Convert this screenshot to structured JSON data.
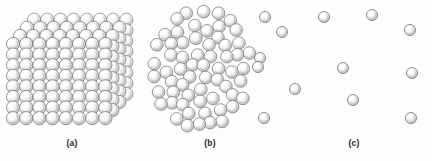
{
  "figure": {
    "name": "states-of-matter-sphere-packing",
    "background_color": "#fdfdfd",
    "sphere_style": {
      "fill_light": "#fdfdfd",
      "fill_mid": "#e4e4e4",
      "fill_shadow": "#bdbdbd",
      "outline_color": "#6f6f6f",
      "highlight_color": "#ffffff"
    }
  },
  "panels": [
    {
      "id": "a",
      "caption": "(a)",
      "description": "ordered cubic close-packed lattice of spheres (solid)",
      "arrangement": "crystalline-cubic-lattice",
      "lattice": {
        "columns": 8,
        "rows": 8,
        "depth_layers": 4,
        "sphere_diameter_px": 13.2,
        "origin_x": 13,
        "origin_y": 44,
        "step_x": 13.2,
        "step_y": 10.6,
        "depth_dx": 7.0,
        "depth_dy": -8.1
      }
    },
    {
      "id": "b",
      "caption": "(b)",
      "description": "randomly packed, closely spaced spheres (liquid)",
      "arrangement": "dense-random-packing",
      "cluster": {
        "sphere_diameter_px": 12.6,
        "center_x": 57,
        "center_y": 68,
        "radius_x": 50,
        "radius_y": 60,
        "count": 96
      }
    },
    {
      "id": "c",
      "caption": "(c)",
      "description": "widely separated spheres moving freely (gas)",
      "arrangement": "sparse-dispersed",
      "spheres": [
        {
          "x": -11,
          "y": 17,
          "d": 11
        },
        {
          "x": 6,
          "y": 32,
          "d": 11
        },
        {
          "x": 48,
          "y": 17,
          "d": 11
        },
        {
          "x": 96,
          "y": 15,
          "d": 11
        },
        {
          "x": 134,
          "y": 30,
          "d": 11
        },
        {
          "x": -16,
          "y": 58,
          "d": 11
        },
        {
          "x": -18,
          "y": 67,
          "d": 11
        },
        {
          "x": 19,
          "y": 89,
          "d": 11
        },
        {
          "x": 136,
          "y": 73,
          "d": 11
        },
        {
          "x": 77,
          "y": 100,
          "d": 11
        },
        {
          "x": 67,
          "y": 68,
          "d": 11
        },
        {
          "x": -12,
          "y": 118,
          "d": 11
        },
        {
          "x": 135,
          "y": 118,
          "d": 11
        }
      ]
    }
  ]
}
